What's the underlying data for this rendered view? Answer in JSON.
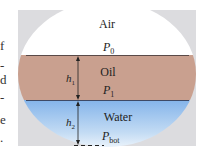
{
  "diagram": {
    "type": "fluid-layers-in-container",
    "layers": [
      {
        "name": "air",
        "label": "Air",
        "pressure_label": "P",
        "pressure_sub": "0",
        "color": "#ffffff"
      },
      {
        "name": "oil",
        "label": "Oil",
        "pressure_label": "P",
        "pressure_sub": "1",
        "height_label": "h",
        "height_sub": "1",
        "color": "#c9a08f"
      },
      {
        "name": "water",
        "label": "Water",
        "pressure_label": "P",
        "pressure_sub": "bot",
        "height_label": "h",
        "height_sub": "2",
        "color": "#8ab8ea"
      }
    ],
    "frame_color": "#dcdcdf",
    "interface_color": "#5a4a48"
  },
  "margin_text_fragments": [
    "f",
    "-",
    "d",
    "-",
    "e",
    "."
  ]
}
